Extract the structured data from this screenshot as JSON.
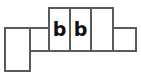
{
  "diagram": {
    "type": "grid-strip",
    "canvas": {
      "width": 141,
      "height": 80,
      "background": "#ffffff"
    },
    "style": {
      "stroke_color": "#5a5a5a",
      "stroke_width": 2,
      "fill_color": "#ffffff",
      "label_color": "#111111"
    },
    "cells": [
      {
        "id": "cell-left-tall",
        "label": "",
        "x": 4,
        "y": 27,
        "width": 27,
        "height": 45,
        "row": "lower",
        "has_label": false
      },
      {
        "id": "cell-mid-left",
        "label": "",
        "x": 29,
        "y": 27,
        "width": 21,
        "height": 25,
        "row": "middle",
        "has_label": false
      },
      {
        "id": "cell-b-first",
        "label": "b",
        "x": 48,
        "y": 7,
        "width": 23,
        "height": 45,
        "row": "upper",
        "has_label": true
      },
      {
        "id": "cell-b-second",
        "label": "b",
        "x": 69,
        "y": 7,
        "width": 23,
        "height": 45,
        "row": "upper",
        "has_label": true
      },
      {
        "id": "cell-upper-right",
        "label": "",
        "x": 90,
        "y": 7,
        "width": 24,
        "height": 45,
        "row": "upper",
        "has_label": false
      },
      {
        "id": "cell-right-small",
        "label": "",
        "x": 112,
        "y": 27,
        "width": 25,
        "height": 25,
        "row": "middle",
        "has_label": false
      }
    ]
  }
}
